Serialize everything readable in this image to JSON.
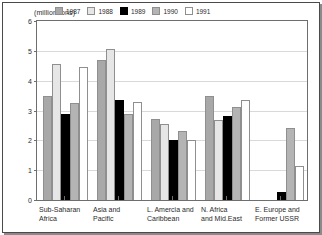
{
  "chart_data": {
    "type": "bar",
    "title": "",
    "subtitle": "",
    "unit_caption": "(million tons)",
    "xlabel": "",
    "ylabel": "(million tons)",
    "ylim": [
      0,
      6
    ],
    "ytick_labels": [
      "6",
      "5",
      "4",
      "3",
      "2",
      "1",
      "0"
    ],
    "ytick_values": [
      6,
      5,
      4,
      3,
      2,
      1,
      0
    ],
    "grid": true,
    "legend_position": "top-center",
    "categories": [
      "Sub-Saharan\nAfrica",
      "Asia and\nPacific",
      "L. Amercia and\nCaribbean",
      "N. Africa\nand Mid.East",
      "E. Europe and\nFormer USSR"
    ],
    "series": [
      {
        "name": "1987",
        "color": "#a8a8a8",
        "values": [
          3.5,
          4.68,
          2.73,
          3.49,
          0.0
        ]
      },
      {
        "name": "1988",
        "color": "#e6e6e6",
        "values": [
          4.55,
          5.05,
          2.56,
          2.68,
          0.0
        ]
      },
      {
        "name": "1989",
        "color": "#000000",
        "values": [
          2.89,
          3.35,
          2.02,
          2.82,
          0.27
        ]
      },
      {
        "name": "1990",
        "color": "#b4b4b4",
        "values": [
          3.25,
          2.88,
          2.32,
          3.13,
          2.43
        ]
      },
      {
        "name": "1991",
        "color": "#ffffff",
        "values": [
          4.45,
          3.27,
          2.01,
          3.35,
          1.13
        ]
      }
    ]
  }
}
